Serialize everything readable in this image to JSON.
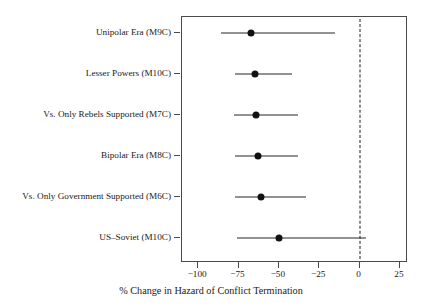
{
  "chart_data": {
    "type": "scatter",
    "title": "",
    "xlabel": "% Change in Hazard of Conflict Termination",
    "ylabel": "",
    "xlim": [
      -110,
      30
    ],
    "xticks": [
      -100,
      -75,
      -50,
      -25,
      0,
      25
    ],
    "xticklabels": [
      "−100",
      "−75",
      "−50",
      "−25",
      "0",
      "25"
    ],
    "grid": false,
    "legend": "none",
    "reference_line": {
      "x": 0,
      "style": "dashed",
      "color": "#1a1a1a"
    },
    "orientation": "horizontal",
    "marker": "filled-circle",
    "categories": [
      "Unipolar Era (M9C)",
      "Lesser Powers (M10C)",
      "Vs. Only Rebels Supported (M7C)",
      "Bipolar Era (M8C)",
      "Vs. Only Government Supported (M6C)",
      "US–Soviet (M10C)"
    ],
    "points": [
      {
        "label": "Unipolar Era (M9C)",
        "estimate": -67,
        "ci_low": -86,
        "ci_high": -15
      },
      {
        "label": "Lesser Powers (M10C)",
        "estimate": -65,
        "ci_low": -77,
        "ci_high": -42
      },
      {
        "label": "Vs. Only Rebels Supported (M7C)",
        "estimate": -64,
        "ci_low": -78,
        "ci_high": -38
      },
      {
        "label": "Bipolar Era (M8C)",
        "estimate": -63,
        "ci_low": -77,
        "ci_high": -38
      },
      {
        "label": "Vs. Only Government Supported (M6C)",
        "estimate": -61,
        "ci_low": -77,
        "ci_high": -33
      },
      {
        "label": "US–Soviet (M10C)",
        "estimate": -50,
        "ci_low": -76,
        "ci_high": 4
      }
    ]
  },
  "axis": {
    "x_title": "% Change in Hazard of Conflict Termination"
  }
}
